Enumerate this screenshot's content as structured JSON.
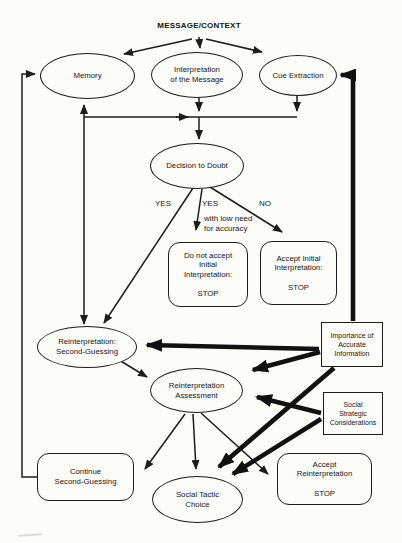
{
  "colors": {
    "ink": "#1c1c1c",
    "background": "#fcfcf9"
  },
  "title": "MESSAGE/CONTEXT",
  "nodes": {
    "memory": "Memory",
    "interpretation": "Interpretation\nof the Message",
    "cue_extraction": "Cue Extraction",
    "decision_to_doubt": "Decision to Doubt",
    "do_not_accept": "Do not accept\nInitial\nInterpretation:\n\nSTOP",
    "accept_initial": "Accept Initial\nInterpretation:\n\nSTOP",
    "second_guessing": "Reinterpretation:\nSecond-Guessing",
    "importance": "Importance of\nAccurate\nInformation",
    "assessment": "Reinterpretation\nAssessment",
    "social_strategic": "Social\nStrategic\nConsiderations",
    "continue_sg": "Continue\nSecond-Guessing",
    "social_tactic": "Social Tactic\nChoice",
    "accept_reinterpretation": "Accept\nReinterpretation\n\nSTOP"
  },
  "edge_labels": {
    "yes_left": "YES",
    "yes_mid": "YES",
    "yes_mid_note": "with low need\nfor accuracy",
    "no": "NO"
  }
}
